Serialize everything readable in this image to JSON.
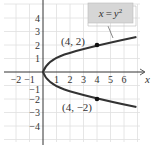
{
  "figure": {
    "equation_label": "x = y²",
    "equation_parts": {
      "lhs": "x",
      "eq": "=",
      "rhs_base": "y",
      "rhs_exp": "2"
    },
    "x_axis_label": "x",
    "y_axis_label": "y",
    "x_ticks": [
      "−2",
      "−1",
      "1",
      "2",
      "3",
      "4",
      "5",
      "6"
    ],
    "y_ticks": [
      "4",
      "3",
      "2",
      "1",
      "−1",
      "−2",
      "−3",
      "−4"
    ],
    "points": [
      {
        "label": "(4, 2)",
        "x": 4,
        "y": 2
      },
      {
        "label": "(4, −2)",
        "x": 4,
        "y": -2
      }
    ],
    "colors": {
      "curve": "#333333",
      "grid": "#dddddd",
      "label_box": "#d9d9d9",
      "axis": "#333333"
    }
  }
}
